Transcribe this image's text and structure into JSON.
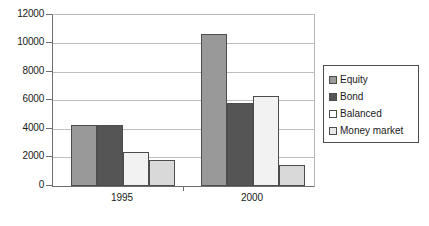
{
  "chart_data": {
    "type": "bar",
    "title": "",
    "subtitle": "",
    "xlabel": "",
    "ylabel": "",
    "categories": [
      "1995",
      "2000"
    ],
    "series": [
      {
        "name": "Equity",
        "values": [
          4300,
          10700
        ],
        "color": "#999999"
      },
      {
        "name": "Bond",
        "values": [
          4250,
          5800
        ],
        "color": "#555555"
      },
      {
        "name": "Balanced",
        "values": [
          2400,
          6350
        ],
        "color": "#f2f2f2"
      },
      {
        "name": "Money market",
        "values": [
          1850,
          1500
        ],
        "color": "#d9d9d9"
      }
    ],
    "ylim": [
      0,
      12000
    ],
    "ytick_labels": [
      "12000",
      "10000",
      "8000",
      "6000",
      "4000",
      "2000",
      "0"
    ],
    "ytick_values": [
      12000,
      10000,
      8000,
      6000,
      4000,
      2000,
      0
    ],
    "grid": true,
    "grid_axis": "y",
    "legend_position": "right",
    "legend_entries": [
      "Equity",
      "Bond",
      "Balanced",
      "Money market"
    ],
    "annotations": []
  },
  "axes": {
    "y_label_0": "12000",
    "y_label_1": "10000",
    "y_label_2": "8000",
    "y_label_3": "6000",
    "y_label_4": "4000",
    "y_label_5": "2000",
    "y_label_6": "0",
    "x_label_0": "1995",
    "x_label_1": "2000"
  },
  "legend": {
    "item_0": "Equity",
    "item_1": "Bond",
    "item_2": "Balanced",
    "item_3": "Money market"
  },
  "colors": {
    "equity": "#999999",
    "bond": "#555555",
    "balanced": "#f2f2f2",
    "money_market": "#d9d9d9",
    "bar_outline": "#4d4d4d",
    "gridline": "#bdbdbd",
    "axis": "#6e6e6e",
    "background": "#ffffff"
  }
}
